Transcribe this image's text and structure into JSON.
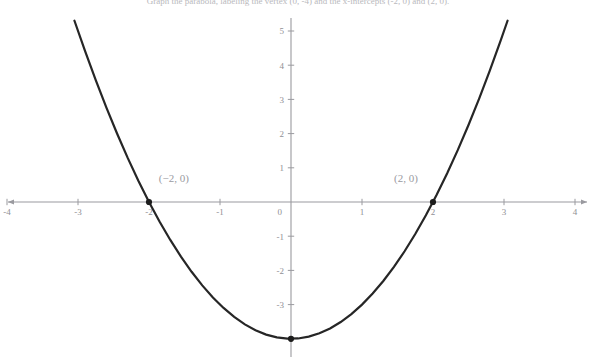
{
  "caption": {
    "text": "Graph the parabola, labeling the vertex (0, -4) and the x-intercepts (-2, 0) and (2, 0)."
  },
  "chart_data": {
    "type": "line",
    "title": "",
    "subtitle": "",
    "xlabel": "",
    "ylabel": "",
    "function": "y = x^2 - 4",
    "grid": false,
    "legend": false,
    "xlim": [
      -4,
      4
    ],
    "ylim": [
      -4,
      5.4
    ],
    "x_ticks": [
      "-4",
      "-3",
      "-2",
      "-1",
      "0",
      "1",
      "2",
      "3",
      "4"
    ],
    "x_tick_values": [
      -4,
      -3,
      -2,
      -1,
      0,
      1,
      2,
      3,
      4
    ],
    "y_ticks": [
      "-3",
      "-2",
      "-1",
      "1",
      "2",
      "3",
      "4",
      "5"
    ],
    "y_tick_values": [
      -3,
      -2,
      -1,
      1,
      2,
      3,
      4,
      5
    ],
    "curve_domain": [
      -3.05,
      3.05
    ],
    "x": [
      -3.05,
      -2.9,
      -2.75,
      -2.6,
      -2.45,
      -2.3,
      -2.15,
      -2.0,
      -1.85,
      -1.7,
      -1.55,
      -1.4,
      -1.25,
      -1.1,
      -0.95,
      -0.8,
      -0.65,
      -0.5,
      -0.35,
      -0.2,
      -0.05,
      0.1,
      0.25,
      0.4,
      0.55,
      0.7,
      0.85,
      1.0,
      1.15,
      1.3,
      1.45,
      1.6,
      1.75,
      1.9,
      2.05,
      2.2,
      2.35,
      2.5,
      2.65,
      2.8,
      2.95,
      3.05
    ],
    "y": [
      5.3,
      4.41,
      3.5625,
      2.76,
      2.0025,
      1.29,
      0.6225,
      0.0,
      -0.5775,
      -1.11,
      -1.5975,
      -2.04,
      -2.4375,
      -2.79,
      -3.0975,
      -3.36,
      -3.5775,
      -3.75,
      -3.8775,
      -3.96,
      -3.9975,
      -3.99,
      -3.9375,
      -3.84,
      -3.6975,
      -3.51,
      -3.2775,
      -3.0,
      -2.6775,
      -2.31,
      -1.8975,
      -1.44,
      -0.9375,
      -0.39,
      0.2025,
      0.84,
      1.5225,
      2.25,
      3.0225,
      3.84,
      4.7025,
      5.3
    ],
    "annotations": [
      {
        "name": "left-x-intercept",
        "label": "(−2, 0)",
        "x": -2,
        "y": 0,
        "label_dx": 0.35,
        "label_dy": 0.58,
        "marker": true
      },
      {
        "name": "right-x-intercept",
        "label": "(2, 0)",
        "x": 2,
        "y": 0,
        "label_dx": -0.38,
        "label_dy": 0.58,
        "marker": true
      },
      {
        "name": "vertex",
        "label": "",
        "x": 0,
        "y": -4,
        "label_dx": 0,
        "label_dy": 0,
        "marker": true
      }
    ],
    "axis_color": "#9a9a9f",
    "curve_color": "#262626",
    "label_color": "#9a9a9f",
    "background": "#ffffff"
  }
}
